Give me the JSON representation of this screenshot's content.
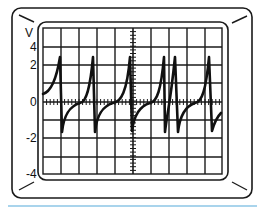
{
  "figure": {
    "colors": {
      "frame": "#1a1a1a",
      "grid": "#1a1a1a",
      "trace": "#111111",
      "background": "#ffffff",
      "underline": "#a9d4ec"
    },
    "y_axis": {
      "unit_label": "V",
      "ticks": [
        {
          "label": "4",
          "y": 47
        },
        {
          "label": "2",
          "y": 65
        },
        {
          "label": "0",
          "y": 102
        },
        {
          "label": "-2",
          "y": 138
        },
        {
          "label": "-4",
          "y": 174
        }
      ]
    },
    "grid": {
      "left": 43,
      "right": 222,
      "top": 28,
      "bottom": 174,
      "columns": 10,
      "rows": 8,
      "center_x": 133,
      "zero_y": 102
    }
  },
  "chart_data": {
    "type": "line",
    "title": "",
    "xlabel": "",
    "ylabel": "V",
    "ylim": [
      -4,
      4
    ],
    "y_tick_labels": [
      "4",
      "2",
      "0",
      "-2",
      "-4"
    ],
    "grid": true,
    "series": [
      {
        "name": "trace",
        "description": "Sawtooth-like spikes: exponential rise to ~+3V then sharp drop to ~-3V, recovering to ~0V; six spikes with the 4th and 5th close together",
        "spikes_x_px": [
          60,
          93,
          130,
          164,
          175,
          209
        ],
        "peak_value_approx": 3,
        "trough_value_approx": -3
      }
    ]
  }
}
